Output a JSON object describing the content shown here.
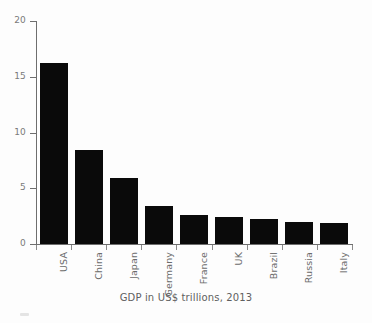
{
  "chart_data": {
    "type": "bar",
    "title": "",
    "caption": "GDP in US$ trillions, 2013",
    "xlabel": "",
    "ylabel": "",
    "ylim": [
      0,
      20
    ],
    "ytick_values": [
      0,
      5,
      10,
      15,
      20
    ],
    "ytick_labels": [
      "0",
      "5",
      "10",
      "15",
      "20"
    ],
    "grid": false,
    "legend": null,
    "bar_color": "#0a0a0a",
    "axis_color": "#6e6e6e",
    "text_color": "#6b6b6b",
    "label_rotation": -90,
    "categories": [
      "USA",
      "China",
      "Japan",
      "Germany",
      "France",
      "UK",
      "Brazil",
      "Russia",
      "Italy"
    ],
    "values": [
      16.2,
      8.4,
      5.9,
      3.4,
      2.6,
      2.4,
      2.2,
      2.0,
      1.9
    ],
    "series": [
      {
        "name": "GDP in US$ trillions, 2013",
        "values": [
          16.2,
          8.4,
          5.9,
          3.4,
          2.6,
          2.4,
          2.2,
          2.0,
          1.9
        ]
      }
    ]
  },
  "figure": {
    "background": "#fdfdfd"
  }
}
